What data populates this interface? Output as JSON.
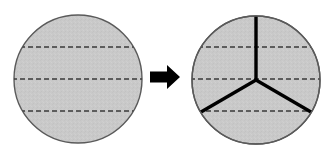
{
  "figure": {
    "canvas": {
      "width": 329,
      "height": 155,
      "background": "#ffffff"
    },
    "colors": {
      "disk_fill": "#c9c9c9",
      "disk_outline": "#5a5a5a",
      "dashed_line": "#3a3a3a",
      "radius_line": "#000000",
      "arrow": "#000000"
    },
    "left_circle": {
      "label": "Undivided disk with three parallel dashed chords",
      "center_x": 78,
      "center_y": 79,
      "radius": 64,
      "outline_width": 1.4,
      "dashed_chords": [
        {
          "name": "upper-chord",
          "y": 47,
          "dash_pattern": "5,3",
          "width": 1.5
        },
        {
          "name": "middle-chord",
          "y": 79,
          "dash_pattern": "5,3",
          "width": 1.5
        },
        {
          "name": "lower-chord",
          "y": 111,
          "dash_pattern": "5,3",
          "width": 1.5
        }
      ]
    },
    "arrow": {
      "label": "Transformation arrow pointing right",
      "glyph_name": "arrow-right-icon",
      "x": 150,
      "y": 65,
      "width": 30,
      "height": 24,
      "shaft_thickness": 11,
      "head_width": 13
    },
    "right_circle": {
      "label": "Disk divided into three equal sectors by a Y junction",
      "center_x": 256,
      "center_y": 80,
      "radius": 64,
      "outline_width": 1.4,
      "dashed_chords": [
        {
          "name": "upper-chord",
          "y": 47,
          "dash_pattern": "5,3",
          "width": 1.5
        },
        {
          "name": "middle-chord",
          "y": 79,
          "dash_pattern": "5,3",
          "width": 1.5
        },
        {
          "name": "lower-chord",
          "y": 111,
          "dash_pattern": "5,3",
          "width": 1.5
        }
      ],
      "radii": [
        {
          "name": "radius-up",
          "angle_deg": 90,
          "end_x": 256,
          "end_y": 16,
          "width": 3.4
        },
        {
          "name": "radius-lower-left",
          "angle_deg": 210,
          "end_x": 201,
          "end_y": 112,
          "width": 3.4
        },
        {
          "name": "radius-lower-right",
          "angle_deg": 330,
          "end_x": 311,
          "end_y": 112,
          "width": 3.4
        }
      ],
      "sector_count": 3,
      "sector_angle_deg": 120
    }
  }
}
